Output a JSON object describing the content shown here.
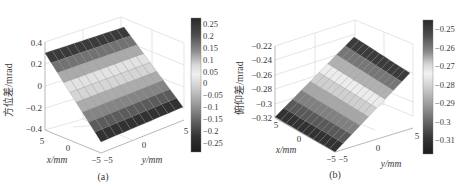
{
  "figure": {
    "panels": [
      {
        "id": "a",
        "caption": "(a)",
        "zlabel": "方位差/mrad",
        "xlabel": "x/mm",
        "ylabel": "y/mm",
        "zticks": [
          "0.4",
          "0.2",
          "0",
          "−0.2",
          "−0.4"
        ],
        "xticks": [
          "5",
          "0",
          "−5"
        ],
        "yticks": [
          "−5",
          "0",
          "5"
        ],
        "colorbar_ticks": [
          "0.25",
          "0.2",
          "0.15",
          "0.1",
          "0.05",
          "0",
          "−0.05",
          "−0.1",
          "−0.15",
          "−0.2",
          "−0.25"
        ]
      },
      {
        "id": "b",
        "caption": "(b)",
        "zlabel": "俯仰差/mrad",
        "xlabel": "x/mm",
        "ylabel": "y/mm",
        "zticks": [
          "−0.22",
          "−0.24",
          "−0.26",
          "−0.28",
          "−0.3",
          "−0.32"
        ],
        "xticks": [
          "5",
          "0",
          "−5"
        ],
        "yticks": [
          "−5",
          "0",
          "5"
        ],
        "colorbar_ticks": [
          "−0.25",
          "−0.26",
          "−0.27",
          "−0.28",
          "−0.29",
          "−0.3",
          "−0.31"
        ]
      }
    ]
  },
  "chart_data": [
    {
      "type": "surface",
      "title": "(a)",
      "xlabel": "x/mm",
      "ylabel": "y/mm",
      "zlabel": "方位差/mrad",
      "xlim": [
        -5,
        5
      ],
      "ylim": [
        -5,
        5
      ],
      "zlim": [
        -0.4,
        0.4
      ],
      "colorbar_range": [
        -0.28,
        0.28
      ],
      "colorbar_ticks": [
        0.25,
        0.2,
        0.15,
        0.1,
        0.05,
        0,
        -0.05,
        -0.1,
        -0.15,
        -0.2,
        -0.25
      ],
      "description": "Planar surface, z varies linearly along x from about 0.28 (x=-5) to about -0.28 (x=5); rendered with banded grayscale colormap (dark at extremes, light near middle).",
      "x": [
        -5,
        -4,
        -3,
        -2,
        -1,
        0,
        1,
        2,
        3,
        4,
        5
      ],
      "z_along_x": [
        0.28,
        0.224,
        0.168,
        0.112,
        0.056,
        0.0,
        -0.056,
        -0.112,
        -0.168,
        -0.224,
        -0.28
      ]
    },
    {
      "type": "surface",
      "title": "(b)",
      "xlabel": "x/mm",
      "ylabel": "y/mm",
      "zlabel": "俯仰差/mrad",
      "xlim": [
        -5,
        5
      ],
      "ylim": [
        -5,
        5
      ],
      "zlim": [
        -0.32,
        -0.22
      ],
      "colorbar_range": [
        -0.316,
        -0.244
      ],
      "colorbar_ticks": [
        -0.25,
        -0.26,
        -0.27,
        -0.28,
        -0.29,
        -0.3,
        -0.31
      ],
      "description": "Planar surface, z varies linearly along y from about -0.316 (y=-5) to about -0.244 (y=5); banded grayscale colormap.",
      "y": [
        -5,
        -4,
        -3,
        -2,
        -1,
        0,
        1,
        2,
        3,
        4,
        5
      ],
      "z_along_y": [
        -0.316,
        -0.309,
        -0.302,
        -0.294,
        -0.287,
        -0.28,
        -0.273,
        -0.266,
        -0.258,
        -0.251,
        -0.244
      ]
    }
  ]
}
